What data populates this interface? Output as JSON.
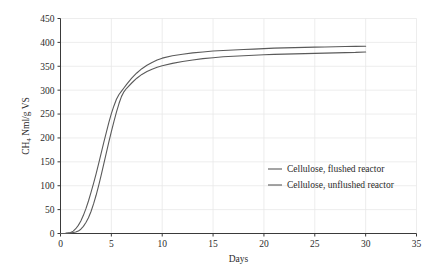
{
  "chart_data": {
    "type": "line",
    "title": "",
    "xlabel": "Days",
    "ylabel": "CH4 Nml/g VS",
    "ylabel_main": "CH",
    "ylabel_sub": "4",
    "ylabel_rest": " Nml/g VS",
    "xlim": [
      0,
      35
    ],
    "ylim": [
      0,
      450
    ],
    "xticks": [
      0,
      5,
      10,
      15,
      20,
      25,
      30,
      35
    ],
    "yticks": [
      0,
      50,
      100,
      150,
      200,
      250,
      300,
      350,
      400,
      450
    ],
    "grid": true,
    "legend_position": "center-right",
    "line_color": "#595959",
    "grid_color": "#e8e8e8",
    "axis_color": "#3a3a3a",
    "series": [
      {
        "name": "Cellulose, flushed reactor",
        "color": "#5a5a5a",
        "x": [
          0,
          0.5,
          1,
          1.25,
          1.5,
          1.75,
          2,
          2.25,
          2.5,
          2.75,
          3,
          3.25,
          3.5,
          3.75,
          4,
          4.25,
          4.5,
          4.75,
          5,
          5.25,
          5.5,
          5.75,
          6,
          6.25,
          6.5,
          7,
          7.5,
          8,
          8.5,
          9,
          9.5,
          10,
          11,
          12,
          13,
          14,
          15,
          16,
          17,
          18,
          19,
          20,
          21,
          22,
          23,
          24,
          25,
          26,
          27,
          28,
          29,
          30
        ],
        "y": [
          0,
          0.5,
          2,
          5,
          10,
          17,
          26,
          38,
          52,
          68,
          86,
          105,
          125,
          146,
          168,
          190,
          211,
          232,
          251,
          267,
          281,
          291,
          298,
          305,
          312,
          325,
          336,
          345,
          352,
          358,
          363,
          367,
          372,
          375,
          378,
          380,
          382,
          383,
          384,
          385,
          386,
          387,
          388,
          388.5,
          389,
          389.5,
          390,
          390.5,
          391,
          391.3,
          391.6,
          392
        ]
      },
      {
        "name": "Cellulose, unflushed reactor",
        "color": "#5a5a5a",
        "x": [
          0,
          0.5,
          1,
          1.5,
          1.75,
          2,
          2.25,
          2.5,
          2.75,
          3,
          3.25,
          3.5,
          3.75,
          4,
          4.25,
          4.5,
          4.75,
          5,
          5.25,
          5.5,
          5.75,
          6,
          6.25,
          6.5,
          7,
          7.5,
          8,
          8.5,
          9,
          9.5,
          10,
          11,
          12,
          13,
          14,
          15,
          16,
          17,
          18,
          19,
          20,
          21,
          22,
          23,
          24,
          25,
          26,
          27,
          28,
          29,
          30
        ],
        "y": [
          0,
          0.3,
          1,
          3,
          5,
          9,
          15,
          23,
          33,
          46,
          62,
          80,
          100,
          122,
          145,
          168,
          191,
          213,
          234,
          254,
          272,
          287,
          297,
          304,
          315,
          325,
          333,
          339,
          344,
          348,
          351,
          356,
          360,
          363,
          366,
          368,
          370,
          371,
          372,
          373,
          374,
          375,
          375.5,
          376,
          376.5,
          377,
          377.5,
          378,
          378.5,
          379,
          380
        ]
      }
    ]
  },
  "legend": {
    "entries": [
      {
        "label": "Cellulose, flushed reactor"
      },
      {
        "label": "Cellulose, unflushed reactor"
      }
    ]
  },
  "axes": {
    "x_title": "Days",
    "x_tick_labels": [
      "0",
      "5",
      "10",
      "15",
      "20",
      "25",
      "30",
      "35"
    ],
    "y_tick_labels": [
      "0",
      "50",
      "100",
      "150",
      "200",
      "250",
      "300",
      "350",
      "400",
      "450"
    ]
  }
}
